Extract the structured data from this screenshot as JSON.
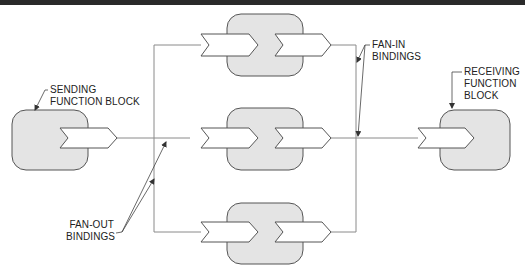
{
  "diagram": {
    "type": "function-block binding diagram",
    "colors": {
      "block_fill": "#e4e4e4",
      "block_stroke": "#555555",
      "arrow_fill": "#ffffff",
      "line": "#888888",
      "leader": "#444444",
      "top_bar": "#2a2a2a"
    },
    "labels": {
      "sending": [
        "SENDING",
        "FUNCTION BLOCK"
      ],
      "receiving": [
        "RECEIVING",
        "FUNCTION",
        "BLOCK"
      ],
      "fan_in": [
        "FAN-IN",
        "BINDINGS"
      ],
      "fan_out": [
        "FAN-OUT",
        "BINDINGS"
      ]
    },
    "nodes": [
      {
        "id": "sending",
        "label": "SENDING FUNCTION BLOCK",
        "ports": [
          "output"
        ]
      },
      {
        "id": "middle-top",
        "ports": [
          "input",
          "output"
        ]
      },
      {
        "id": "middle-center",
        "ports": [
          "input",
          "output"
        ]
      },
      {
        "id": "middle-bottom",
        "ports": [
          "input",
          "output"
        ]
      },
      {
        "id": "receiving",
        "label": "RECEIVING FUNCTION BLOCK",
        "ports": [
          "input"
        ]
      }
    ],
    "edges": [
      {
        "from": "sending",
        "to": "middle-top",
        "kind": "fan-out"
      },
      {
        "from": "sending",
        "to": "middle-center",
        "kind": "fan-out"
      },
      {
        "from": "sending",
        "to": "middle-bottom",
        "kind": "fan-out"
      },
      {
        "from": "middle-top",
        "to": "receiving",
        "kind": "fan-in"
      },
      {
        "from": "middle-center",
        "to": "receiving",
        "kind": "fan-in"
      },
      {
        "from": "middle-bottom",
        "to": "receiving",
        "kind": "fan-in"
      }
    ]
  }
}
